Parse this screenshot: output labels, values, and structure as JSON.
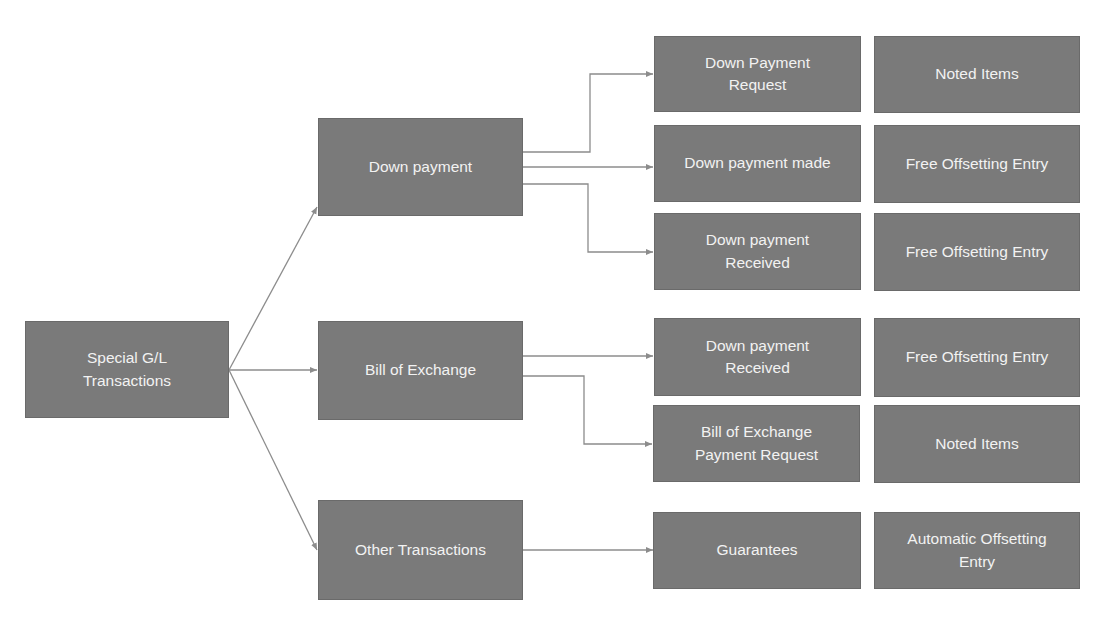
{
  "diagram": {
    "root": {
      "label": "Special G/L Transactions"
    },
    "categories": [
      {
        "label": "Down payment"
      },
      {
        "label": "Bill of Exchange"
      },
      {
        "label": "Other Transactions"
      }
    ],
    "transactions": [
      {
        "category": "Down payment",
        "label": "Down Payment Request",
        "entry": "Noted Items"
      },
      {
        "category": "Down payment",
        "label": "Down payment made",
        "entry": "Free Offsetting Entry"
      },
      {
        "category": "Down payment",
        "label": "Down payment Received",
        "entry": "Free Offsetting Entry"
      },
      {
        "category": "Bill of Exchange",
        "label": "Down payment Received",
        "entry": "Free Offsetting Entry"
      },
      {
        "category": "Bill of Exchange",
        "label": "Bill of Exchange Payment Request",
        "entry": "Noted Items"
      },
      {
        "category": "Other Transactions",
        "label": "Guarantees",
        "entry": "Automatic Offsetting Entry"
      }
    ],
    "colors": {
      "box_fill": "#7a7a7a",
      "box_text": "#f2f2f2",
      "connector": "#8c8c8c"
    }
  }
}
